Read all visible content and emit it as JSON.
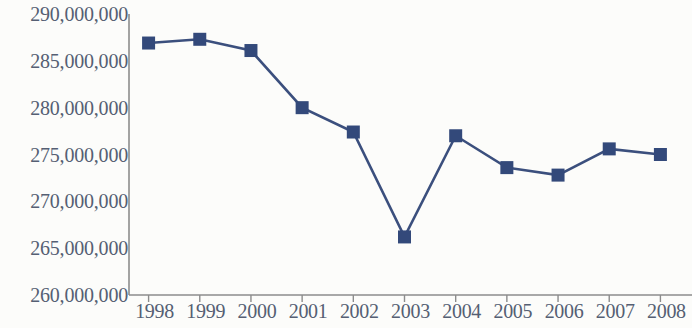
{
  "chart_data": {
    "type": "line",
    "title": "",
    "subtitle": "",
    "xlabel": "",
    "ylabel": "",
    "categories": [
      "1998",
      "1999",
      "2000",
      "2001",
      "2002",
      "2003",
      "2004",
      "2005",
      "2006",
      "2007",
      "2008"
    ],
    "series": [
      {
        "name": "",
        "values": [
          286900000,
          287300000,
          286100000,
          280000000,
          277400000,
          266200000,
          277000000,
          273600000,
          272800000,
          275600000,
          275000000
        ]
      }
    ],
    "ylim": [
      260000000,
      290000000
    ],
    "ytick_values": [
      260000000,
      265000000,
      270000000,
      275000000,
      280000000,
      285000000,
      290000000
    ],
    "ytick_labels": [
      "260,000,000",
      "265,000,000",
      "270,000,000",
      "275,000,000",
      "280,000,000",
      "285,000,000",
      "290,000,000"
    ],
    "xtick_labels": [
      "1998",
      "1999",
      "2000",
      "2001",
      "2002",
      "2003",
      "2004",
      "2005",
      "2006",
      "2007",
      "2008"
    ],
    "grid": false,
    "legend": false,
    "legend_position": "none",
    "marker": "square",
    "line_color": "#3B4F7D",
    "marker_color": "#33497A",
    "axis_color": "#8c8c8c",
    "tick_label_color": "#555f73",
    "background_color": "#fcfcfa"
  }
}
